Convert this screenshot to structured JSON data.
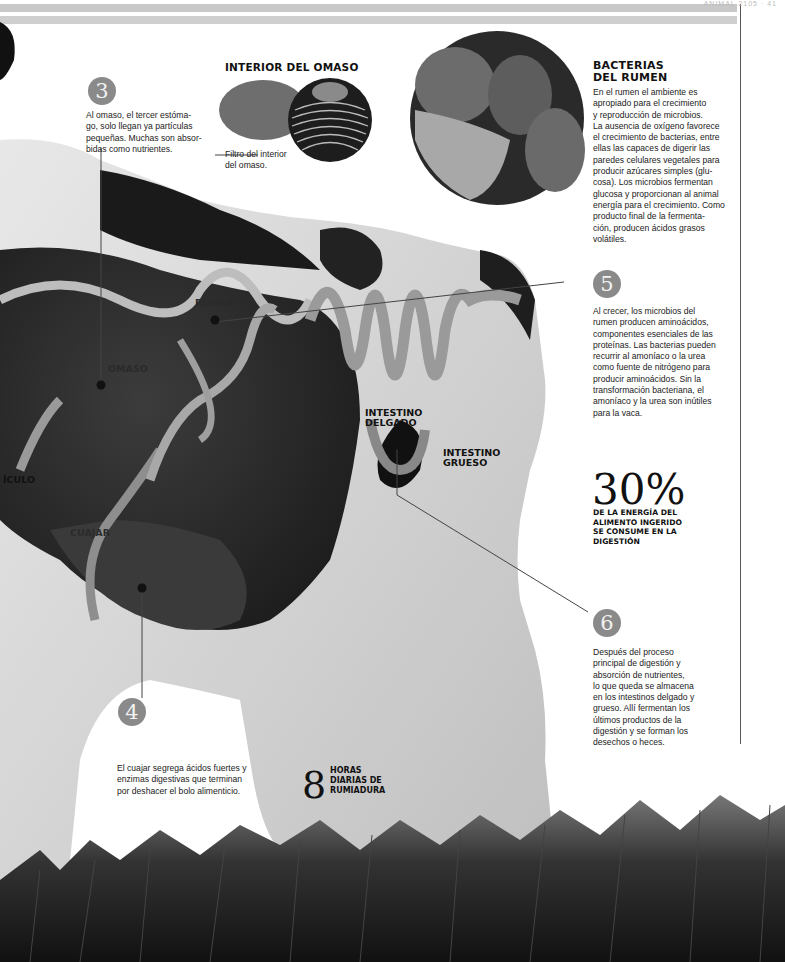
{
  "page": {
    "header_label": "ANIMAL 2105 · 41"
  },
  "steps": [
    {
      "number": "3",
      "text": "Al omaso, el tercer estómago, solo llegan ya partículas pequeñas. Muchas son absorbidas como nutrientes.",
      "lines": [
        "Al omaso, el tercer estóma-",
        "go, solo llegan ya partículas",
        "pequeñas. Muchas son absor-",
        "bidas como nutrientes."
      ]
    },
    {
      "number": "4",
      "lines": [
        "El cuajar segrega ácidos fuertes y",
        "enzimas digestivas que terminan",
        "por deshacer el bolo alimenticio."
      ]
    },
    {
      "number": "5",
      "lines": [
        "Al crecer, los microbios del",
        "rumen producen aminoácidos,",
        "componentes esenciales de las",
        "proteínas. Las bacterias pueden",
        "recurrir al amoníaco o la urea",
        "como fuente de nitrógeno para",
        "producir aminoácidos. Sin la",
        "transformación bacteriana, el",
        "amoníaco y la urea son inútiles",
        "para la vaca."
      ]
    },
    {
      "number": "6",
      "lines": [
        "Después del proceso",
        "principal de digestión y",
        "absorción de nutrientes,",
        "lo que queda se almacena",
        "en los intestinos delgado y",
        "grueso. Allí fermentan los",
        "últimos productos de la",
        "digestión y se forman los",
        "desechos o heces."
      ]
    }
  ],
  "omaso_inset": {
    "title": "INTERIOR DEL OMASO",
    "caption_lines": [
      "Filtro del interior",
      "del omaso."
    ]
  },
  "bacteria_inset": {
    "title_lines": [
      "BACTERIAS",
      "DEL RUMEN"
    ],
    "lines": [
      "En el rumen el ambiente es",
      "apropiado para el crecimiento",
      "y reproducción de microbios.",
      "La ausencia de oxígeno favorece",
      "el crecimiento de bacterias, entre",
      "ellas las capaces de digerir las",
      "paredes celulares vegetales para",
      "producir azúcares simples (glu-",
      "cosa). Los microbios fermentan",
      "glucosa y proporcionan al animal",
      "energía para el crecimiento. Como",
      "producto final de la fermenta-",
      "ción, producen ácidos grasos",
      "volátiles."
    ]
  },
  "organ_labels": {
    "rumen": "RUMEN",
    "omaso": "OMASO",
    "reticulo": "ÍCULO",
    "cuajar": "CUAJAR",
    "intestino_delgado": [
      "INTESTINO",
      "DELGADO"
    ],
    "intestino_grueso": [
      "INTESTINO",
      "GRUESO"
    ]
  },
  "stats": {
    "energy": {
      "value": "30%",
      "caption_lines": [
        "DE LA ENERGÍA DEL",
        "ALIMENTO INGERIDO",
        "SE CONSUME EN LA",
        "DIGESTIÓN"
      ]
    },
    "rumination": {
      "value": "8",
      "caption_lines": [
        "HORAS",
        "DIARIAS DE",
        "RUMIADURA"
      ]
    }
  },
  "colors": {
    "badge": "#8a8a8a",
    "text": "#222222",
    "rule": "#c9c9c9"
  }
}
